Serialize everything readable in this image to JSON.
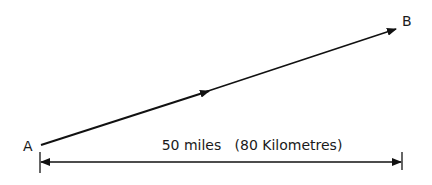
{
  "diagram": {
    "point_a_label": "A",
    "point_b_label": "B",
    "distance_label": "50 miles   (80 Kilometres)",
    "distance_miles": 50,
    "distance_km": 80,
    "colors": {
      "line": "#111111",
      "background": "#ffffff"
    }
  }
}
